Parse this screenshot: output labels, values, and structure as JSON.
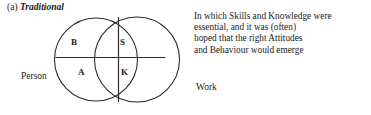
{
  "figure": {
    "caption": {
      "index": "(a)",
      "title": "Traditional"
    },
    "diagram": {
      "type": "two-overlapping-circles-venn",
      "left_circle_label": "Person",
      "right_circle_label": "Work",
      "quadrants": [
        {
          "key": "B",
          "label": "B",
          "meaning": "Behaviour"
        },
        {
          "key": "S",
          "label": "S",
          "meaning": "Skills"
        },
        {
          "key": "A",
          "label": "A",
          "meaning": "Attitudes"
        },
        {
          "key": "K",
          "label": "K",
          "meaning": "Knowledge"
        }
      ],
      "stroke_color": "#2b2b2b",
      "fill_color": "#ffffff"
    },
    "description": {
      "lines": [
        "In which Skills and Knowledge were",
        "essential, and it was (often)",
        "hoped that the right Attitudes",
        "and Behaviour would emerge"
      ]
    }
  }
}
